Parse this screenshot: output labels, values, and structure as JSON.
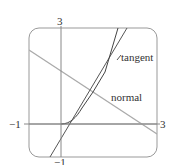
{
  "diagram": {
    "type": "function-graph",
    "curve": "y = x^(3/2)",
    "point": [
      1,
      1
    ],
    "x_range": [
      -1,
      3
    ],
    "y_range": [
      -1,
      3
    ],
    "labels": {
      "y_top": "3",
      "x_left": "−1",
      "x_right": "3",
      "y_bottom": "−1",
      "tangent": "tangent",
      "normal": "normal"
    },
    "colors": {
      "frame": "#999999",
      "axes": "#888888",
      "curve": "#444444",
      "tangent": "#555555",
      "normal": "#aaaaaa"
    }
  }
}
